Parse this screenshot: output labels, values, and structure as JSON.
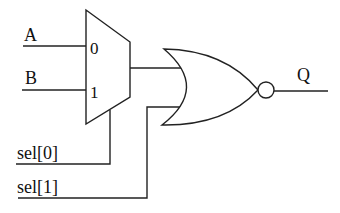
{
  "diagram": {
    "type": "digital-logic-circuit",
    "components": [
      {
        "id": "mux",
        "kind": "2:1 multiplexer",
        "inputs": [
          "0",
          "1"
        ],
        "select": "sel[0]"
      },
      {
        "id": "nor",
        "kind": "NOR gate",
        "inputs": [
          "mux_out",
          "sel[1]"
        ],
        "output": "Q"
      }
    ],
    "signals": {
      "a": "A",
      "b": "B",
      "sel0": "sel[0]",
      "sel1": "sel[1]",
      "q": "Q"
    },
    "mux_ports": {
      "in0": "0",
      "in1": "1"
    },
    "colors": {
      "stroke": "#222222",
      "background": "#ffffff"
    }
  }
}
